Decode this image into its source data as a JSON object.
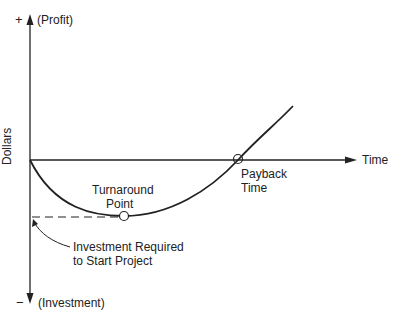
{
  "axis": {
    "y_label": "Dollars",
    "y_top_sign": "+",
    "y_top_label": "(Profit)",
    "y_bottom_sign": "−",
    "y_bottom_label": "(Investment)",
    "x_label": "Time"
  },
  "annotations": {
    "turnaround_line1": "Turnaround",
    "turnaround_line2": "Point",
    "payback_line1": "Payback",
    "payback_line2": "Time",
    "investment_line1": "Investment Required",
    "investment_line2": "to Start Project"
  },
  "colors": {
    "ink": "#222222",
    "background": "#ffffff"
  }
}
